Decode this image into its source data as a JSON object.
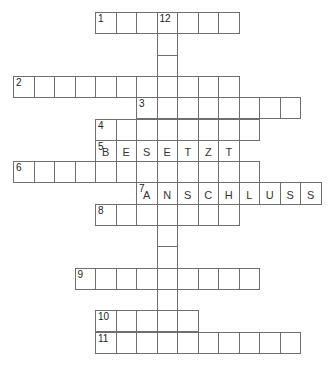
{
  "puzzle": {
    "cell_width": 20.5,
    "cell_height": 21.3,
    "origin_x": 13,
    "origin_y": 12,
    "border_color": "#6e6e6e",
    "entries": [
      {
        "number": "1",
        "direction": "across",
        "row": 0,
        "col": 4,
        "length": 7,
        "answer": ""
      },
      {
        "number": "2",
        "direction": "across",
        "row": 3,
        "col": 0,
        "length": 11,
        "answer": ""
      },
      {
        "number": "3",
        "direction": "across",
        "row": 4,
        "col": 6,
        "length": 8,
        "answer": ""
      },
      {
        "number": "4",
        "direction": "across",
        "row": 5,
        "col": 4,
        "length": 8,
        "answer": ""
      },
      {
        "number": "5",
        "direction": "across",
        "row": 6,
        "col": 4,
        "length": 7,
        "answer": "BESETZT"
      },
      {
        "number": "6",
        "direction": "across",
        "row": 7,
        "col": 0,
        "length": 12,
        "answer": ""
      },
      {
        "number": "7",
        "direction": "across",
        "row": 8,
        "col": 6,
        "length": 9,
        "answer": "ANSCHLUSS"
      },
      {
        "number": "8",
        "direction": "across",
        "row": 9,
        "col": 4,
        "length": 7,
        "answer": ""
      },
      {
        "number": "9",
        "direction": "across",
        "row": 12,
        "col": 3,
        "length": 9,
        "answer": ""
      },
      {
        "number": "10",
        "direction": "across",
        "row": 14,
        "col": 4,
        "length": 5,
        "answer": ""
      },
      {
        "number": "11",
        "direction": "across",
        "row": 15,
        "col": 4,
        "length": 10,
        "answer": ""
      },
      {
        "number": "12",
        "direction": "down",
        "row": 0,
        "col": 7,
        "length": 16,
        "answer": ""
      }
    ]
  }
}
